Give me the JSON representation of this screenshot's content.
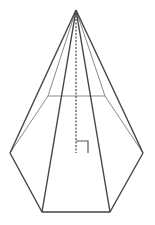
{
  "diagram": {
    "type": "hexagonal-pyramid",
    "colors": {
      "edge": "#444444",
      "hidden_edge": "#888888",
      "height_line": "#555555",
      "background": "#ffffff"
    },
    "points": {
      "apex": [
        76,
        10
      ],
      "left": [
        10,
        153
      ],
      "front_left": [
        42,
        212
      ],
      "front_right": [
        110,
        212
      ],
      "right": [
        143,
        153
      ],
      "back_right": [
        105,
        96
      ],
      "back_left": [
        48,
        96
      ],
      "foot": [
        76,
        153
      ]
    },
    "right_angle_marker": {
      "x": 76,
      "y": 141,
      "size": 12
    }
  }
}
